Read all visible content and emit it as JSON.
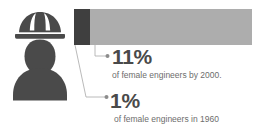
{
  "chart_data": {
    "type": "bar",
    "title": "",
    "subtitle": "",
    "orientation": "horizontal",
    "stacked": true,
    "categories": [
      "1960",
      "2000"
    ],
    "series": [
      {
        "name": "Share of female engineers",
        "values": [
          1,
          11
        ],
        "unit": "%"
      }
    ],
    "xlabel": "",
    "ylabel": "",
    "xlim": [
      0,
      11
    ],
    "grid": false,
    "legend": "none",
    "annotations": [
      {
        "value": "11%",
        "caption": "of female engineers by 2000.",
        "points_to": "full-bar-end"
      },
      {
        "value": "1%",
        "caption": "of female engineers in 1960",
        "points_to": "dark-segment"
      }
    ],
    "colors": {
      "segment_1960": "#3f3f3f",
      "segment_2000": "#adadad",
      "value_text": "#4a4a4a",
      "caption_text": "#6d6d6d",
      "leader_line": "#a8a8a8",
      "icon": "#4a4a4a",
      "background": "#ffffff"
    }
  },
  "icon": {
    "name": "female-engineer-hardhat-icon",
    "label": "Female engineer wearing hard hat",
    "color": "#4a4a4a"
  },
  "bar": {
    "segment_1960_label": "1%",
    "segment_2000_label": "11%"
  },
  "callouts": {
    "primary": {
      "value": "11%",
      "caption": "of female engineers by 2000."
    },
    "secondary": {
      "value": "1%",
      "caption": "of female engineers in 1960"
    }
  }
}
